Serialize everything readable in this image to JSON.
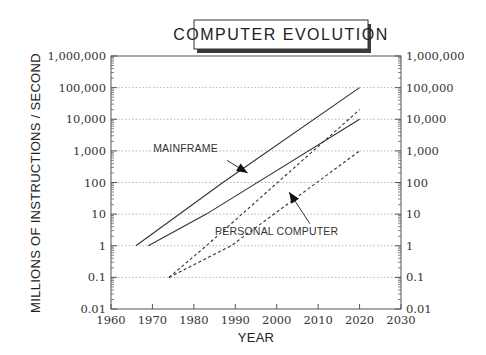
{
  "chart_data": {
    "type": "line",
    "title": "COMPUTER EVOLUTION",
    "xlabel": "YEAR",
    "ylabel": "MILLIONS OF INSTRUCTIONS / SECOND",
    "xlim": [
      1960,
      2030
    ],
    "ylim": [
      0.01,
      1000000
    ],
    "yscale": "log",
    "grid": "horizontal-dotted",
    "x_ticks": [
      "1960",
      "1970",
      "1980",
      "1990",
      "2000",
      "2010",
      "2020",
      "2030"
    ],
    "y_ticks": [
      "0.01",
      "0.1",
      "1",
      "10",
      "100",
      "1,000",
      "10,000",
      "100,000",
      "1,000,000"
    ],
    "y_tick_values": [
      0.01,
      0.1,
      1,
      10,
      100,
      1000,
      10000,
      100000,
      1000000
    ],
    "x_tick_values": [
      1960,
      1970,
      1980,
      1990,
      2000,
      2010,
      2020,
      2030
    ],
    "right_axis_mirror": true,
    "series": [
      {
        "name": "Mainframe (high)",
        "group": "MAINFRAME",
        "style": "solid",
        "x": [
          1966,
          1987,
          2020
        ],
        "y": [
          1,
          100,
          100000
        ]
      },
      {
        "name": "Mainframe (low)",
        "group": "MAINFRAME",
        "style": "solid",
        "x": [
          1969,
          1983,
          2020
        ],
        "y": [
          1,
          10,
          10000
        ]
      },
      {
        "name": "Personal Computer (high)",
        "group": "PERSONAL COMPUTER",
        "style": "dashed",
        "x": [
          1974,
          1983,
          2020
        ],
        "y": [
          0.1,
          1,
          20000
        ]
      },
      {
        "name": "Personal Computer (low)",
        "group": "PERSONAL COMPUTER",
        "style": "dashed",
        "x": [
          1974,
          1989,
          2020
        ],
        "y": [
          0.1,
          1,
          1000
        ]
      }
    ],
    "annotations": [
      {
        "text": "MAINFRAME",
        "label_at": [
          1978,
          900
        ],
        "arrow_from": [
          1988,
          500
        ],
        "arrow_to": [
          1993,
          200
        ]
      },
      {
        "text": "PERSONAL COMPUTER",
        "label_at": [
          2000,
          2.2
        ],
        "arrow_from": [
          2008,
          5
        ],
        "arrow_to": [
          2003,
          50
        ]
      }
    ]
  }
}
